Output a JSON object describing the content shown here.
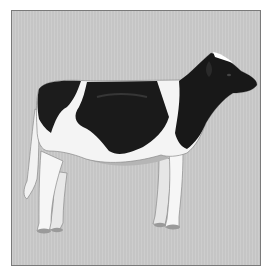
{
  "image": {
    "subject": "Holstein dairy cow, side view facing right",
    "alt": "Illustration of a black and white Holstein cow standing in profile",
    "colors": {
      "background": "#c9c9c9",
      "border": "#7a7a7a",
      "black_patch": "#1a1a1a",
      "white_coat": "#f4f4f4",
      "shadow": "#a8a8a8"
    }
  }
}
